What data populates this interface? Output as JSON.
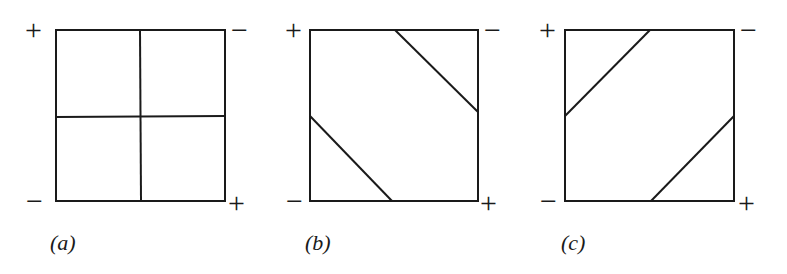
{
  "figure": {
    "stroke_color": "#1a1a1a",
    "background": "#ffffff",
    "panels": [
      {
        "id": "a",
        "caption": "(a)",
        "corners": {
          "top_left": "+",
          "top_right": "−",
          "bottom_left": "−",
          "bottom_right": "+"
        },
        "division": "four quadrants (cross)"
      },
      {
        "id": "b",
        "caption": "(b)",
        "corners": {
          "top_left": "+",
          "top_right": "−",
          "bottom_left": "−",
          "bottom_right": "+"
        },
        "division": "two diagonal cuts isolating top-right and bottom-left corners"
      },
      {
        "id": "c",
        "caption": "(c)",
        "corners": {
          "top_left": "+",
          "top_right": "−",
          "bottom_left": "−",
          "bottom_right": "+"
        },
        "division": "two diagonal cuts isolating top-left and bottom-right corners"
      }
    ]
  }
}
